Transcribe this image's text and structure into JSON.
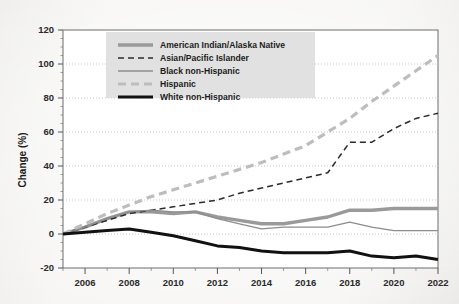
{
  "chart_data": {
    "type": "line",
    "title": "",
    "xlabel": "",
    "ylabel": "Change (%)",
    "xlim": [
      2005,
      2022
    ],
    "ylim": [
      -20,
      120
    ],
    "grid": true,
    "legend_position": "top-left-inside",
    "x": [
      2005,
      2006,
      2007,
      2008,
      2009,
      2010,
      2011,
      2012,
      2013,
      2014,
      2015,
      2016,
      2017,
      2018,
      2019,
      2020,
      2021,
      2022
    ],
    "xticks": [
      "2006",
      "2008",
      "2010",
      "2012",
      "2014",
      "2016",
      "2018",
      "2020",
      "2022"
    ],
    "xtick_values": [
      2006,
      2008,
      2010,
      2012,
      2014,
      2016,
      2018,
      2020,
      2022
    ],
    "yticks": [
      "-20",
      "0",
      "20",
      "40",
      "60",
      "80",
      "100",
      "120"
    ],
    "ytick_values": [
      -20,
      0,
      20,
      40,
      60,
      80,
      100,
      120
    ],
    "series": [
      {
        "name": "American Indian/Alaska Native",
        "style": "solid",
        "color": "#9a9a9a",
        "width": 3.4,
        "values": [
          0,
          4,
          9,
          13,
          13,
          12,
          13,
          10,
          8,
          6,
          6,
          8,
          10,
          14,
          14,
          15,
          15,
          15
        ]
      },
      {
        "name": "Asian/Pacific Islander",
        "style": "dashed",
        "color": "#2b2b2b",
        "width": 1.5,
        "values": [
          0,
          4,
          8,
          12,
          14,
          16,
          18,
          20,
          24,
          27,
          30,
          33,
          36,
          54,
          54,
          62,
          68,
          71
        ]
      },
      {
        "name": "Black non-Hispanic",
        "style": "solid",
        "color": "#8c8c8c",
        "width": 1.3,
        "values": [
          0,
          4,
          9,
          13,
          14,
          13,
          13,
          9,
          6,
          3,
          4,
          4,
          4,
          7,
          4,
          2,
          2,
          2
        ]
      },
      {
        "name": "Hispanic",
        "style": "dashed",
        "color": "#bdbdbd",
        "width": 3.2,
        "values": [
          0,
          6,
          12,
          17,
          22,
          26,
          30,
          34,
          38,
          42,
          47,
          52,
          60,
          68,
          78,
          87,
          96,
          105
        ]
      },
      {
        "name": "White non-Hispanic",
        "style": "solid",
        "color": "#111111",
        "width": 3.0,
        "values": [
          0,
          1,
          2,
          3,
          1,
          -1,
          -4,
          -7,
          -8,
          -10,
          -11,
          -11,
          -11,
          -10,
          -13,
          -14,
          -13,
          -15
        ]
      }
    ]
  },
  "axes": {
    "y_title": "Change (%)"
  },
  "legend": {
    "items": [
      {
        "label": "American Indian/Alaska Native"
      },
      {
        "label": "Asian/Pacific Islander"
      },
      {
        "label": "Black non-Hispanic"
      },
      {
        "label": "Hispanic"
      },
      {
        "label": "White non-Hispanic"
      }
    ]
  }
}
